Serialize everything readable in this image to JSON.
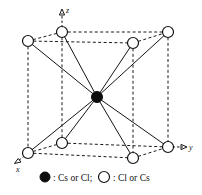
{
  "figure": {
    "axes": [
      {
        "name": "z-axis",
        "label": "z",
        "direction": "up"
      },
      {
        "name": "y-axis",
        "label": "y",
        "direction": "right"
      },
      {
        "name": "x-axis",
        "label": "x",
        "direction": "down-left"
      }
    ],
    "legend": {
      "filled_symbol": "filled-circle",
      "filled_label": ": Cs or Cl;",
      "open_symbol": "open-circle",
      "open_label": ": Cl or Cs"
    },
    "colors": {
      "filled_atom": "#0d0d0d",
      "open_atom": "#ffffff",
      "stroke": "#121212",
      "background": "#ffffff"
    },
    "atoms": {
      "center_count": 1,
      "corner_count": 8,
      "center_type": "Cs or Cl",
      "corner_type": "Cl or Cs"
    }
  }
}
